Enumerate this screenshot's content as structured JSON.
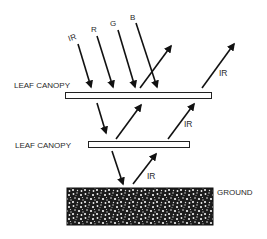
{
  "diagram": {
    "type": "radiation-reflection-diagram",
    "incident_labels": [
      "IR",
      "R",
      "G",
      "B"
    ],
    "upper_canopy": {
      "label": "LEAF CANOPY"
    },
    "lower_canopy": {
      "label": "LEAF CANOPY"
    },
    "ground": {
      "label": "GROUND"
    },
    "reflected_labels": {
      "upper_right": "IR",
      "middle_right": "IR",
      "bottom": "IR"
    },
    "colors": {
      "line": "#111111",
      "ground_fill": "#1a1a1a",
      "background": "#ffffff"
    }
  }
}
